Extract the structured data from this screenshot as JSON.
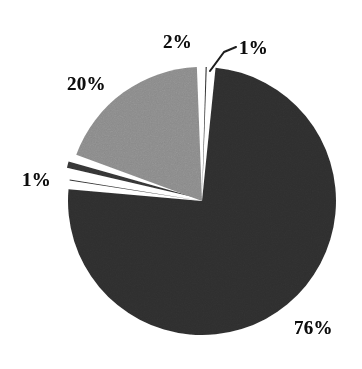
{
  "chart_data": {
    "type": "pie",
    "title": "",
    "subtitle": "",
    "xlabel": "",
    "ylabel": "",
    "legend": "none",
    "grid": false,
    "units": "percent",
    "total": 100,
    "categories": [
      "76%",
      "1%",
      "2%",
      "20%",
      "1%"
    ],
    "values": [
      76,
      1,
      2,
      20,
      1
    ],
    "slices": [
      {
        "label": "76%",
        "value": 76,
        "color": "#2e2e2e",
        "shade": "dark",
        "exploded": false,
        "start_angle_deg": 3.6,
        "end_angle_deg": 277.2,
        "label_position": "outside-bottom-right"
      },
      {
        "label": "1%",
        "value": 1,
        "color": "#2e2e2e",
        "shade": "dark",
        "exploded": false,
        "start_angle_deg": 277.2,
        "end_angle_deg": 280.8,
        "label_position": "outside-left",
        "leader_line": false
      },
      {
        "label": "20%",
        "value": 20,
        "color": "#8a8a8a",
        "shade": "light-gray",
        "exploded": true,
        "start_angle_deg": 280.8,
        "end_angle_deg": 352.8,
        "label_position": "outside-upper-left"
      },
      {
        "label": "2%",
        "value": 2,
        "color": "#343434",
        "shade": "dark",
        "exploded": false,
        "start_angle_deg": 352.8,
        "end_angle_deg": 360.0,
        "label_position": "outside-top"
      },
      {
        "label": "1%",
        "value": 1,
        "color": "#2e2e2e",
        "shade": "dark",
        "exploded": false,
        "start_angle_deg": 0.0,
        "end_angle_deg": 3.6,
        "label_position": "outside-top-right",
        "leader_line": true
      }
    ],
    "labels": {
      "slice_76": "76%",
      "slice_20": "20%",
      "slice_2": "2%",
      "slice_1_top": "1%",
      "slice_1_left": "1%"
    },
    "colors": {
      "background": "#ffffff",
      "dark_slice": "#2e2e2e",
      "light_slice": "#8a8a8a",
      "separator": "#ffffff",
      "label_text": "#0d0d0d",
      "leader_line": "#1a1a1a"
    },
    "geometry": {
      "center_x": 202,
      "center_y": 201,
      "radius": 134
    }
  }
}
